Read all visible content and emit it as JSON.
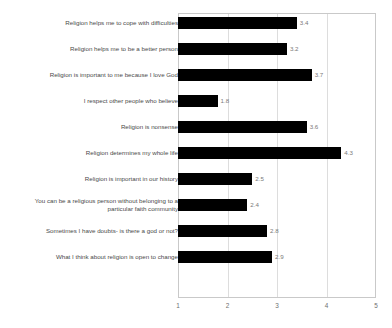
{
  "chart_data": {
    "type": "bar",
    "orientation": "horizontal",
    "title": "",
    "subtitle": "",
    "xlabel": "",
    "ylabel": "",
    "xlim": [
      1,
      5
    ],
    "xticks": [
      "1",
      "2",
      "3",
      "4",
      "5"
    ],
    "gridlines": [
      "2",
      "3",
      "4"
    ],
    "grid": true,
    "legend": false,
    "bar_color": "#000000",
    "value_label_color": "#7a7a7a",
    "category_label_color": "#4a4a4a",
    "frame_color": "#c9c9c9",
    "categories": [
      "Religion helps me to cope with difficulties",
      "Religion helps me to be a better person",
      "Religion is important to me because I love God",
      "I respect other people who believe",
      "Religion is nonsense",
      "Religion determines my whole life",
      "Religion is important in our history",
      "You can be a religious person without belonging to a\nparticular faith community",
      "Sometimes I have doubts- is there a god or not?",
      "What I think about religion is open to change"
    ],
    "values": [
      3.4,
      3.2,
      3.7,
      1.8,
      3.6,
      4.3,
      2.5,
      2.4,
      2.8,
      2.9
    ],
    "value_labels": [
      "3.4",
      "3.2",
      "3.7",
      "1.8",
      "3.6",
      "4.3",
      "2.5",
      "2.4",
      "2.8",
      "2.9"
    ]
  }
}
